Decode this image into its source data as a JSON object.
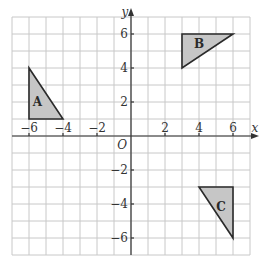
{
  "diagram": {
    "type": "coordinate-grid",
    "x_range": [
      -7,
      7
    ],
    "y_range": [
      -7,
      7
    ],
    "axis_labels": {
      "x": "x",
      "y": "y"
    },
    "origin_label": "O",
    "x_ticks": [
      {
        "value": -6,
        "label": "−6"
      },
      {
        "value": -4,
        "label": "−4"
      },
      {
        "value": -2,
        "label": "−2"
      },
      {
        "value": 2,
        "label": "2"
      },
      {
        "value": 4,
        "label": "4"
      },
      {
        "value": 6,
        "label": "6"
      }
    ],
    "y_ticks": [
      {
        "value": 6,
        "label": "6"
      },
      {
        "value": 4,
        "label": "4"
      },
      {
        "value": 2,
        "label": "2"
      },
      {
        "value": -2,
        "label": "−2"
      },
      {
        "value": -4,
        "label": "−4"
      },
      {
        "value": -6,
        "label": "−6"
      }
    ],
    "shapes": [
      {
        "name": "A",
        "label": "A",
        "vertices": [
          [
            -6,
            4
          ],
          [
            -6,
            1
          ],
          [
            -4,
            1
          ]
        ],
        "label_pos": [
          -5.5,
          2
        ]
      },
      {
        "name": "B",
        "label": "B",
        "vertices": [
          [
            3,
            6
          ],
          [
            6,
            6
          ],
          [
            3,
            4
          ]
        ],
        "label_pos": [
          4,
          5.4
        ]
      },
      {
        "name": "C",
        "label": "C",
        "vertices": [
          [
            4,
            -3
          ],
          [
            6,
            -3
          ],
          [
            6,
            -6
          ]
        ],
        "label_pos": [
          5.3,
          -4.2
        ]
      }
    ],
    "colors": {
      "grid": "#c8c8c8",
      "axis": "#333333",
      "shape_fill": "#c6c6c6",
      "shape_stroke": "#2a2a2a"
    }
  }
}
